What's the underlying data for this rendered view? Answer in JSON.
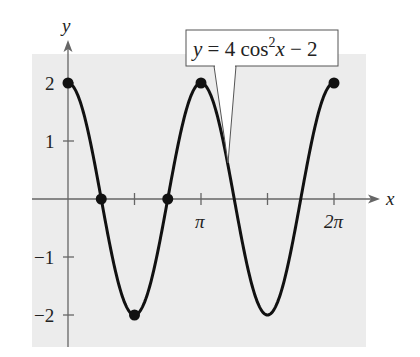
{
  "chart_data": {
    "type": "line",
    "title": "",
    "equation_label": "y = 4 cos²x − 2",
    "equation_parts": {
      "lhs": "y",
      "eq": " = 4 cos",
      "sup": "2",
      "var": "x",
      "rest": " − 2"
    },
    "xlabel": "x",
    "ylabel": "y",
    "xlim": [
      0,
      6.2832
    ],
    "ylim": [
      -2,
      2
    ],
    "x_tick_labels": [
      {
        "value": 3.1416,
        "label": "π"
      },
      {
        "value": 6.2832,
        "label": "2π"
      }
    ],
    "x_ticks": [
      1.5708,
      3.1416,
      4.7124,
      6.2832
    ],
    "y_tick_labels": [
      {
        "value": 2,
        "label": "2"
      },
      {
        "value": 1,
        "label": "1"
      },
      {
        "value": -1,
        "label": "−1"
      },
      {
        "value": -2,
        "label": "−2"
      }
    ],
    "function": "4*cos(x)^2 - 2",
    "marked_points": [
      {
        "x": 0,
        "y": 2
      },
      {
        "x": 0.7854,
        "y": 0
      },
      {
        "x": 1.5708,
        "y": -2
      },
      {
        "x": 2.3562,
        "y": 0
      },
      {
        "x": 3.1416,
        "y": 2
      },
      {
        "x": 6.2832,
        "y": 2
      }
    ],
    "grid": false,
    "background": "#ececec",
    "line_color": "#111111"
  }
}
